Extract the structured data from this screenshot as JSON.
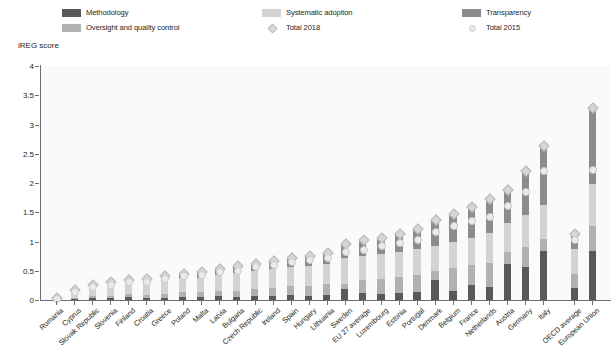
{
  "legend": {
    "items": [
      {
        "label": "Methodology",
        "key": "methodology",
        "color": "#58595b",
        "type": "swatch",
        "icon": "legend-swatch-methodology"
      },
      {
        "label": "Systematic adoption",
        "key": "systematic_adoption",
        "color": "#d3d3d3",
        "type": "swatch",
        "icon": "legend-swatch-systematic-adoption"
      },
      {
        "label": "Transparency",
        "key": "transparency",
        "color": "#8b8c8e",
        "type": "swatch",
        "icon": "legend-swatch-transparency"
      },
      {
        "label": "Oversight and quality control",
        "key": "oversight_and_quality_control",
        "color": "#b0b1b3",
        "type": "swatch",
        "icon": "legend-swatch-oversight"
      },
      {
        "label": "Total 2018",
        "key": "total_2018",
        "color": "#d6d6d6",
        "type": "diamond",
        "icon": "legend-marker-total-2018"
      },
      {
        "label": "Total 2015",
        "key": "total_2015",
        "color": "#ebebeb",
        "type": "circle",
        "icon": "legend-marker-total-2015"
      }
    ]
  },
  "axis": {
    "y_title": "iREG score",
    "y_ticks": [
      "0",
      "0.5",
      "1",
      "1.5",
      "2",
      "2.5",
      "3",
      "3.5",
      "4"
    ]
  },
  "chart_data": {
    "type": "bar",
    "title": "",
    "xlabel": "",
    "ylabel": "iREG score",
    "ylim": [
      0,
      4
    ],
    "ytick_values": [
      0,
      0.5,
      1,
      1.5,
      2,
      2.5,
      3,
      3.5,
      4
    ],
    "grid": false,
    "stacked": true,
    "legend_position": "top",
    "categories": [
      "Romania",
      "Cyprus",
      "Slovak Republic",
      "Slovenia",
      "Finland",
      "Croatia",
      "Greece",
      "Poland",
      "Malta",
      "Latvia",
      "Bulgaria",
      "Czech Republic",
      "Ireland",
      "Spain",
      "Hungary",
      "Lithuania",
      "Sweden",
      "EU 27 average",
      "Luxembourg",
      "Estonia",
      "Portugal",
      "Denmark",
      "Belgium",
      "France",
      "Netherlands",
      "Austria",
      "Germany",
      "Italy",
      "OECD average",
      "European Union"
    ],
    "series": [
      {
        "name": "Methodology",
        "color": "#58595b",
        "values": [
          0.03,
          0.02,
          0.03,
          0.03,
          0.05,
          0.04,
          0.04,
          0.05,
          0.05,
          0.06,
          0.05,
          0.06,
          0.07,
          0.08,
          0.07,
          0.09,
          0.18,
          0.12,
          0.1,
          0.12,
          0.13,
          0.34,
          0.16,
          0.26,
          0.22,
          0.62,
          0.57,
          0.83,
          0.2,
          0.83
        ]
      },
      {
        "name": "Oversight and quality control",
        "color": "#b0b1b3",
        "values": [
          0.0,
          0.02,
          0.03,
          0.04,
          0.05,
          0.05,
          0.07,
          0.08,
          0.08,
          0.1,
          0.11,
          0.13,
          0.14,
          0.16,
          0.17,
          0.19,
          0.1,
          0.23,
          0.26,
          0.28,
          0.3,
          0.16,
          0.38,
          0.33,
          0.42,
          0.2,
          0.33,
          0.22,
          0.24,
          0.43
        ]
      },
      {
        "name": "Systematic adoption",
        "color": "#d3d3d3",
        "values": [
          0.02,
          0.1,
          0.16,
          0.19,
          0.19,
          0.2,
          0.22,
          0.24,
          0.25,
          0.26,
          0.3,
          0.3,
          0.32,
          0.33,
          0.34,
          0.34,
          0.43,
          0.4,
          0.42,
          0.42,
          0.44,
          0.42,
          0.45,
          0.47,
          0.5,
          0.5,
          0.55,
          0.58,
          0.44,
          0.72
        ]
      },
      {
        "name": "Transparency",
        "color": "#8b8c8e",
        "values": [
          0.0,
          0.04,
          0.05,
          0.06,
          0.07,
          0.08,
          0.09,
          0.1,
          0.12,
          0.12,
          0.13,
          0.15,
          0.16,
          0.17,
          0.19,
          0.2,
          0.27,
          0.3,
          0.3,
          0.33,
          0.36,
          0.46,
          0.5,
          0.54,
          0.62,
          0.58,
          0.78,
          1.02,
          0.27,
          1.32
        ]
      }
    ],
    "markers": [
      {
        "name": "Total 2018",
        "shape": "diamond",
        "color": "#d6d6d6",
        "values": [
          0.05,
          0.18,
          0.27,
          0.32,
          0.36,
          0.37,
          0.42,
          0.47,
          0.5,
          0.54,
          0.59,
          0.64,
          0.69,
          0.74,
          0.77,
          0.82,
          0.98,
          1.05,
          1.08,
          1.15,
          1.23,
          1.38,
          1.49,
          1.6,
          1.74,
          1.9,
          2.23,
          2.65,
          1.15,
          3.3
        ]
      },
      {
        "name": "Total 2015",
        "shape": "circle",
        "color": "#ebebeb",
        "values": [
          0.04,
          0.16,
          0.24,
          0.28,
          0.33,
          0.33,
          0.38,
          0.42,
          0.44,
          0.5,
          0.52,
          0.58,
          0.62,
          0.66,
          0.7,
          0.74,
          0.84,
          0.88,
          0.94,
          1.0,
          1.05,
          1.18,
          1.28,
          1.36,
          1.44,
          1.63,
          1.86,
          2.22,
          1.05,
          2.24
        ]
      }
    ]
  }
}
